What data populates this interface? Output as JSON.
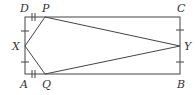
{
  "diagram": {
    "type": "geometry",
    "labels": {
      "A": "A",
      "B": "B",
      "C": "C",
      "D": "D",
      "P": "P",
      "Q": "Q",
      "X": "X",
      "Y": "Y"
    },
    "colors": {
      "stroke": "#444444",
      "text": "#333333"
    }
  }
}
